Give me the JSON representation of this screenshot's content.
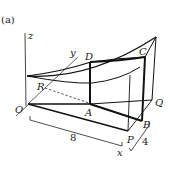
{
  "figure": {
    "panel_label": "(a)",
    "axes": {
      "x": "x",
      "y": "y",
      "z": "z"
    },
    "points": {
      "O": "O",
      "A": "A",
      "B": "B",
      "C": "C",
      "D": "D",
      "P": "P",
      "Q": "Q",
      "R": "R"
    },
    "dimensions": {
      "length": "8",
      "width": "4"
    },
    "colors": {
      "stroke": "#111111",
      "background": "#ffffff"
    }
  }
}
